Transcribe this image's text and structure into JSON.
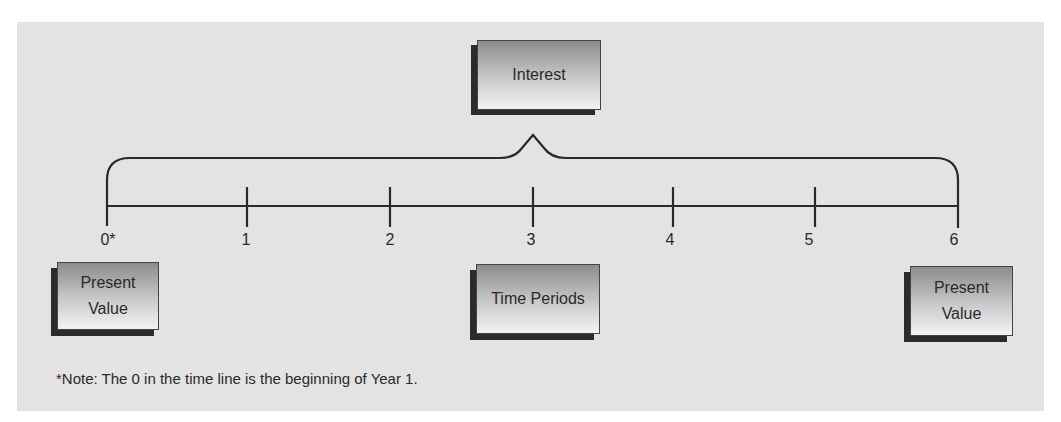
{
  "diagram": {
    "type": "time-value-of-money timeline",
    "top_box": {
      "label": "Interest"
    },
    "center_box": {
      "label": "Time Periods"
    },
    "left_box": {
      "label_line1": "Present",
      "label_line2": "Value"
    },
    "right_box": {
      "label_line1": "Present",
      "label_line2": "Value"
    },
    "ticks": [
      {
        "label": "0*"
      },
      {
        "label": "1"
      },
      {
        "label": "2"
      },
      {
        "label": "3"
      },
      {
        "label": "4"
      },
      {
        "label": "5"
      },
      {
        "label": "6"
      }
    ],
    "note": "*Note: The 0 in the time line is the beginning of Year 1.",
    "colors": {
      "panel_bg": "#e3e3e3",
      "line": "#2a2a2a",
      "box_shadow": "#2b2b2b",
      "text": "#2a2a2a"
    }
  }
}
